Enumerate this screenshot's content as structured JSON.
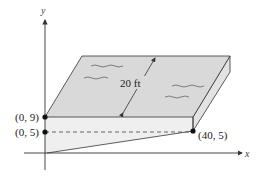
{
  "diagram": {
    "type": "swimming-pool-cross-section",
    "axes": {
      "x_label": "x",
      "y_label": "y"
    },
    "points": [
      {
        "label": "(0, 9)",
        "x": 0,
        "y": 9
      },
      {
        "label": "(0, 5)",
        "x": 0,
        "y": 5
      },
      {
        "label": "(40, 5)",
        "x": 40,
        "y": 5
      }
    ],
    "dimension_label": "20 ft",
    "colors": {
      "water_top": "#d9d9d9",
      "water_side": "#e6e6e6",
      "pool_front": "#efefef",
      "stroke": "#333333"
    }
  }
}
